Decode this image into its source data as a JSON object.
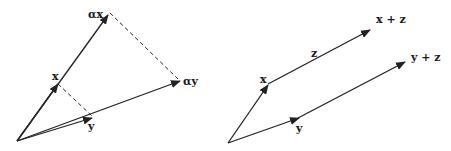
{
  "left_panel": {
    "description": "Scalar multiplication of vectors x and y by alpha",
    "labels": {
      "x": "x",
      "y": "y",
      "alpha_x": "αx",
      "alpha_y": "αy"
    }
  },
  "right_panel": {
    "description": "Translation of vectors x and y by vector z",
    "labels": {
      "x": "x",
      "y": "y",
      "z": "z",
      "x_plus_z": "x + z",
      "y_plus_z": "y + z"
    }
  },
  "colors": {
    "stroke": "#222222",
    "background": "#ffffff"
  }
}
